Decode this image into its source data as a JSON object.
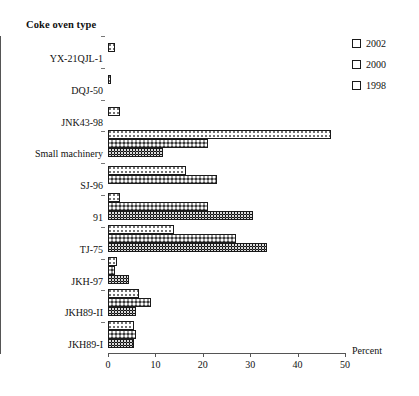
{
  "chart_data": {
    "type": "bar",
    "orientation": "horizontal",
    "title": "",
    "ylabel": "Coke oven type",
    "xlabel": "Percent",
    "xlim": [
      0,
      50
    ],
    "xticks": [
      0,
      10,
      20,
      30,
      40,
      50
    ],
    "xtick_labels": [
      "0",
      "10",
      "20",
      "30",
      "40",
      "50"
    ],
    "grid": false,
    "legend_position": "top-right",
    "categories": [
      "YX-21QJL-1",
      "DQJ-50",
      "JNK43-98",
      "Small machinery",
      "SJ-96",
      "91",
      "TJ-75",
      "JKH-97",
      "JKH89-II",
      "JKH89-I"
    ],
    "series": [
      {
        "name": "2002",
        "color": "#ffffff",
        "pattern": "sparse-dots",
        "values": [
          1.5,
          0.4,
          2.5,
          47.0,
          16.5,
          2.5,
          14.0,
          2.0,
          6.5,
          5.5
        ]
      },
      {
        "name": "2000",
        "color": "#9a9a9a",
        "pattern": "grey-checker",
        "values": [
          null,
          null,
          null,
          21.0,
          23.0,
          21.0,
          27.0,
          1.5,
          9.0,
          6.0
        ]
      },
      {
        "name": "1998",
        "color": "#141414",
        "pattern": "dark-checker",
        "values": [
          null,
          null,
          null,
          11.5,
          null,
          30.5,
          33.5,
          4.5,
          6.0,
          5.5
        ]
      }
    ]
  },
  "legend": {
    "entries": [
      {
        "label": "2002"
      },
      {
        "label": "2000"
      },
      {
        "label": "1998"
      }
    ]
  },
  "axis": {
    "y_title": "Coke oven type",
    "x_caption": "Percent"
  }
}
